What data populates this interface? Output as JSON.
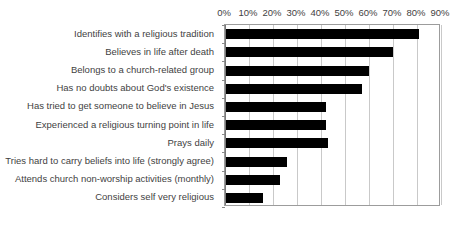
{
  "chart_data": {
    "type": "bar",
    "orientation": "horizontal",
    "title": "",
    "subtitle": "",
    "xlabel": "",
    "ylabel": "",
    "xlim": [
      0,
      90
    ],
    "xtick_step": 10,
    "xtick_labels": [
      "0%",
      "10%",
      "20%",
      "30%",
      "40%",
      "50%",
      "60%",
      "70%",
      "80%",
      "90%"
    ],
    "xtick_values": [
      0,
      10,
      20,
      30,
      40,
      50,
      60,
      70,
      80,
      90
    ],
    "grid": true,
    "legend": "none",
    "value_suffix": "%",
    "categories": [
      "Identifies with a religious tradition",
      "Believes in life after death",
      "Belongs to a church-related group",
      "Has no doubts about God's existence",
      "Has tried to get someone to believe in Jesus",
      "Experienced a religious turning point in life",
      "Prays daily",
      "Tries hard to carry beliefs into life (strongly agree)",
      "Attends church non-worship activities (monthly)",
      "Considers self very religious"
    ],
    "values": [
      81,
      70,
      60,
      57,
      42,
      42,
      43,
      26,
      23,
      16
    ],
    "bar_color": "#000000",
    "gridline_color": "#c9c9c9",
    "axis_color": "#9c9c9c",
    "text_color": "#3f3f3f",
    "plot_background": "#ffffff"
  }
}
